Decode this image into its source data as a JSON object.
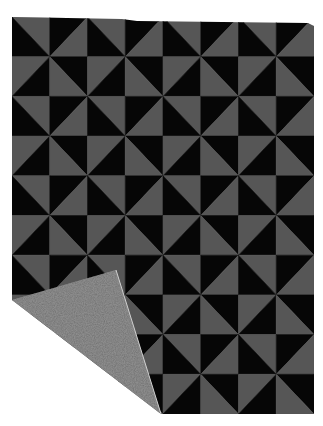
{
  "image": {
    "subject": "Pinwheel pattern throw blanket with folded corner",
    "background": "#ffffff"
  },
  "blanket": {
    "x": 12,
    "y": 17,
    "width": 302,
    "height": 397,
    "columns": 8,
    "rows": 10,
    "colors": {
      "dark": "#060606",
      "light": "#565656",
      "reverse_side": "#8c8c8c",
      "reverse_speckle": "#6f6f6f"
    },
    "tile_pattern": [
      [
        {
          "diagonal": "tl-br",
          "a": "light",
          "b": "dark"
        },
        {
          "diagonal": "bl-tr",
          "a": "dark",
          "b": "light"
        }
      ],
      [
        {
          "diagonal": "bl-tr",
          "a": "light",
          "b": "dark"
        },
        {
          "diagonal": "tl-br",
          "a": "dark",
          "b": "light"
        }
      ]
    ]
  },
  "fold": {
    "points": [
      [
        12,
        300
      ],
      [
        116,
        270
      ],
      [
        161,
        414
      ]
    ],
    "hidden_corner": [
      [
        12,
        300
      ],
      [
        12,
        414
      ],
      [
        161,
        414
      ]
    ]
  }
}
